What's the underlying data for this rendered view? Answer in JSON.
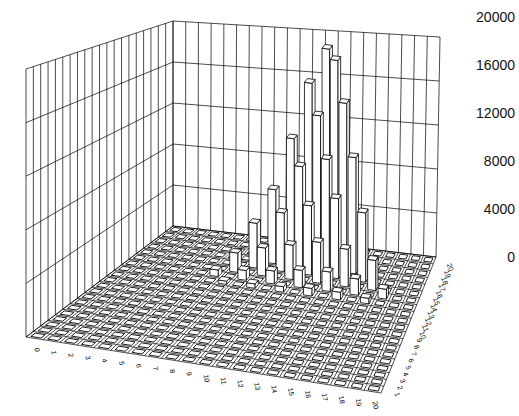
{
  "chart_data": {
    "type": "bar3d",
    "title": "",
    "xlabel": "",
    "ylabel": "",
    "zlabel": "",
    "x_tick_labels": [
      "0",
      "1",
      "2",
      "3",
      "4",
      "5",
      "6",
      "7",
      "8",
      "9",
      "10",
      "11",
      "12",
      "13",
      "14",
      "15",
      "16",
      "17",
      "18",
      "19",
      "20"
    ],
    "y_tick_labels": [
      "1",
      "2",
      "3",
      "4",
      "5",
      "6",
      "7",
      "8",
      "9",
      "10",
      "11",
      "12",
      "13",
      "14",
      "15",
      "16",
      "17",
      "18",
      "19",
      "20"
    ],
    "z_tick_labels": [
      "0",
      "4000",
      "8000",
      "12000",
      "16000",
      "20000"
    ],
    "zlim": [
      0,
      20000
    ],
    "grid": true,
    "bar_color": "#ffffff",
    "edge_color": "#000000",
    "peak_bars": [
      {
        "x": 12,
        "y": 20,
        "value": 19500
      },
      {
        "x": 13,
        "y": 19,
        "value": 19000
      },
      {
        "x": 11,
        "y": 19,
        "value": 16500
      },
      {
        "x": 14,
        "y": 18,
        "value": 15500
      },
      {
        "x": 12,
        "y": 18,
        "value": 14000
      },
      {
        "x": 10,
        "y": 18,
        "value": 11500
      },
      {
        "x": 15,
        "y": 17,
        "value": 11000
      },
      {
        "x": 13,
        "y": 17,
        "value": 10500
      },
      {
        "x": 11,
        "y": 17,
        "value": 9500
      },
      {
        "x": 9,
        "y": 17,
        "value": 7000
      },
      {
        "x": 16,
        "y": 16,
        "value": 6500
      },
      {
        "x": 14,
        "y": 16,
        "value": 7500
      },
      {
        "x": 12,
        "y": 16,
        "value": 6500
      },
      {
        "x": 10,
        "y": 16,
        "value": 5500
      },
      {
        "x": 8,
        "y": 16,
        "value": 4200
      },
      {
        "x": 17,
        "y": 15,
        "value": 2800
      },
      {
        "x": 15,
        "y": 15,
        "value": 3500
      },
      {
        "x": 13,
        "y": 15,
        "value": 3800
      },
      {
        "x": 11,
        "y": 15,
        "value": 3200
      },
      {
        "x": 9,
        "y": 15,
        "value": 2600
      },
      {
        "x": 7,
        "y": 15,
        "value": 1800
      },
      {
        "x": 18,
        "y": 14,
        "value": 900
      },
      {
        "x": 16,
        "y": 14,
        "value": 1500
      },
      {
        "x": 14,
        "y": 14,
        "value": 1800
      },
      {
        "x": 12,
        "y": 14,
        "value": 1600
      },
      {
        "x": 10,
        "y": 14,
        "value": 1200
      },
      {
        "x": 8,
        "y": 14,
        "value": 900
      },
      {
        "x": 6,
        "y": 14,
        "value": 600
      },
      {
        "x": 17,
        "y": 13,
        "value": 500
      },
      {
        "x": 15,
        "y": 13,
        "value": 700
      },
      {
        "x": 13,
        "y": 13,
        "value": 700
      },
      {
        "x": 11,
        "y": 13,
        "value": 500
      },
      {
        "x": 9,
        "y": 13,
        "value": 400
      },
      {
        "x": 7,
        "y": 13,
        "value": 300
      }
    ]
  }
}
